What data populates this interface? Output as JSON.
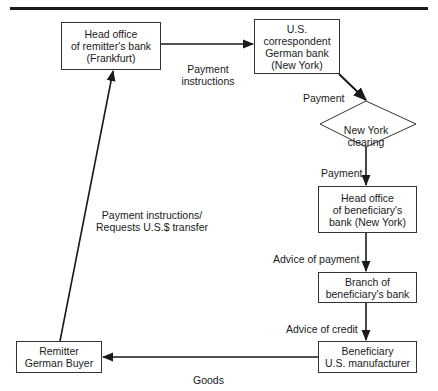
{
  "diagram": {
    "nodes": [
      {
        "id": "remitter_head_office",
        "label": "Head office\nof remitter's bank\n(Frankfurt)",
        "shape": "rect"
      },
      {
        "id": "us_correspondent",
        "label": "U.S.\ncorrespondent\nGerman bank\n(New York)",
        "shape": "rect"
      },
      {
        "id": "ny_clearing",
        "label": "New York\nclearing",
        "shape": "diamond"
      },
      {
        "id": "beneficiary_head_office",
        "label": "Head office\nof beneficiary's\nbank (New York)",
        "shape": "rect"
      },
      {
        "id": "beneficiary_branch",
        "label": "Branch of\nbeneficiary's bank",
        "shape": "rect"
      },
      {
        "id": "beneficiary",
        "label": "Beneficiary\nU.S. manufacturer",
        "shape": "rect"
      },
      {
        "id": "remitter",
        "label": "Remitter\nGerman Buyer",
        "shape": "rect"
      }
    ],
    "edges": [
      {
        "from": "remitter_head_office",
        "to": "us_correspondent",
        "label": "Payment\ninstructions"
      },
      {
        "from": "us_correspondent",
        "to": "ny_clearing",
        "label": "Payment"
      },
      {
        "from": "ny_clearing",
        "to": "beneficiary_head_office",
        "label": "Payment"
      },
      {
        "from": "beneficiary_head_office",
        "to": "beneficiary_branch",
        "label": "Advice of payment"
      },
      {
        "from": "beneficiary_branch",
        "to": "beneficiary",
        "label": "Advice of credit"
      },
      {
        "from": "beneficiary",
        "to": "remitter",
        "label": "Goods"
      },
      {
        "from": "remitter",
        "to": "remitter_head_office",
        "label": "Payment instructions/\nRequests U.S.$ transfer"
      }
    ],
    "colors": {
      "line": "#1a1a1a",
      "background": "#ffffff"
    }
  }
}
